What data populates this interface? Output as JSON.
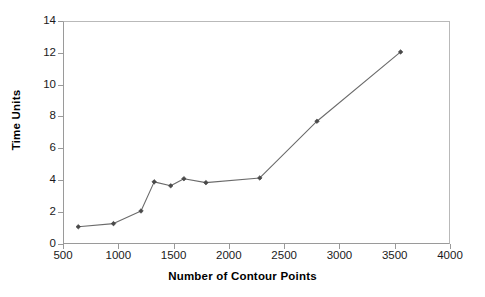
{
  "chart_data": {
    "type": "line",
    "title": "",
    "xlabel": "Number of Contour Points",
    "ylabel": "Time Units",
    "xlim": [
      500,
      4000
    ],
    "ylim": [
      0,
      14
    ],
    "xticks": [
      500,
      1000,
      1500,
      2000,
      2500,
      3000,
      3500,
      4000
    ],
    "yticks": [
      0,
      2,
      4,
      6,
      8,
      10,
      12,
      14
    ],
    "xtick_labels": [
      "500",
      "1000",
      "1500",
      "2000",
      "2500",
      "3000",
      "3500",
      "4000"
    ],
    "ytick_labels": [
      "0",
      "2",
      "4",
      "6",
      "8",
      "10",
      "12",
      "14"
    ],
    "grid": false,
    "legend": false,
    "marker": "diamond",
    "line_color": "#6b6b6b",
    "marker_color": "#4a4a4a",
    "series": [
      {
        "name": "Time Units",
        "x": [
          630,
          950,
          1200,
          1320,
          1470,
          1590,
          1790,
          2280,
          2800,
          3560
        ],
        "y": [
          1.0,
          1.2,
          2.0,
          3.85,
          3.6,
          4.05,
          3.8,
          4.1,
          7.7,
          12.1
        ]
      }
    ]
  }
}
